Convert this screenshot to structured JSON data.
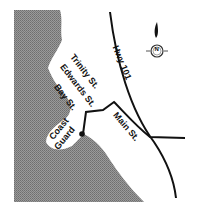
{
  "map": {
    "streets": {
      "hwy": "Hwy 101",
      "trinity": "Trinity St.",
      "edwards": "Edwards St.",
      "bay": "Bay St.",
      "main": "Main St."
    },
    "landmark": {
      "coast_guard_line1": "Coast",
      "coast_guard_line2": "Guard"
    },
    "compass": {
      "label": "N"
    },
    "colors": {
      "water": "#8a8a8a",
      "land": "#ffffff",
      "road": "#111111"
    }
  }
}
